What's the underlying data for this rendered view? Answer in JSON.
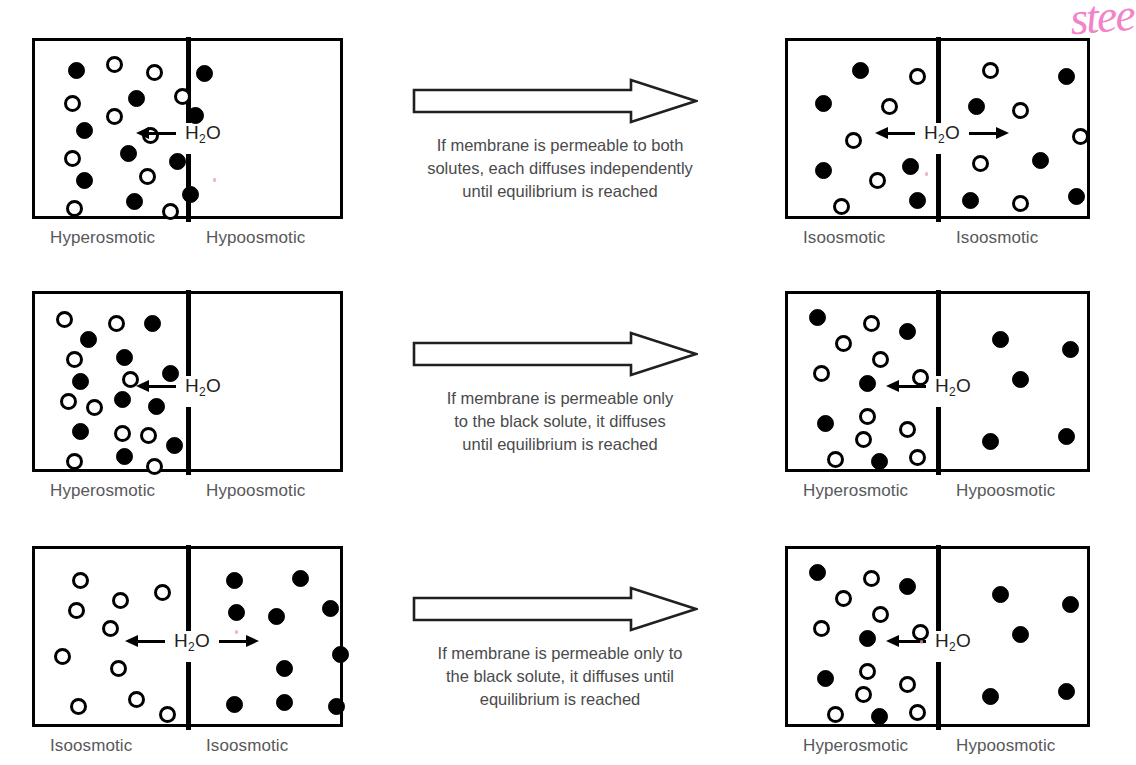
{
  "figure": {
    "handwriting_note": "stee",
    "h2o_label_main": "H",
    "h2o_label_sub": "2",
    "h2o_label_tail": "O"
  },
  "rows": [
    {
      "id": "row-permeable-both",
      "center": {
        "arrow_name": "process-arrow",
        "lines": [
          "If membrane is permeable to both",
          "solutes, each diffuses independently",
          "until equilibrium is reached"
        ]
      },
      "before": {
        "left_caption": "Hyperosmotic",
        "right_caption": "Hypoosmotic",
        "flow": "left",
        "left_particles": [
          {
            "t": "black",
            "x": 24,
            "y": 12
          },
          {
            "t": "white",
            "x": 62,
            "y": 6
          },
          {
            "t": "white",
            "x": 102,
            "y": 14
          },
          {
            "t": "black",
            "x": 152,
            "y": 15
          },
          {
            "t": "white",
            "x": 20,
            "y": 45
          },
          {
            "t": "black",
            "x": 84,
            "y": 40
          },
          {
            "t": "white",
            "x": 130,
            "y": 38
          },
          {
            "t": "white",
            "x": 62,
            "y": 58
          },
          {
            "t": "black",
            "x": 143,
            "y": 57
          },
          {
            "t": "black",
            "x": 32,
            "y": 72
          },
          {
            "t": "white",
            "x": 98,
            "y": 77
          },
          {
            "t": "black",
            "x": 76,
            "y": 95
          },
          {
            "t": "white",
            "x": 20,
            "y": 100
          },
          {
            "t": "black",
            "x": 125,
            "y": 103
          },
          {
            "t": "black",
            "x": 32,
            "y": 122
          },
          {
            "t": "white",
            "x": 95,
            "y": 118
          },
          {
            "t": "black",
            "x": 82,
            "y": 143
          },
          {
            "t": "black",
            "x": 138,
            "y": 136
          },
          {
            "t": "white",
            "x": 22,
            "y": 150
          },
          {
            "t": "white",
            "x": 118,
            "y": 153
          }
        ],
        "right_particles": []
      },
      "after": {
        "left_caption": "Isoosmotic",
        "right_caption": "Isoosmotic",
        "flow": "both",
        "left_particles": [
          {
            "t": "black",
            "x": 55,
            "y": 12
          },
          {
            "t": "white",
            "x": 112,
            "y": 18
          },
          {
            "t": "black",
            "x": 18,
            "y": 45
          },
          {
            "t": "white",
            "x": 84,
            "y": 48
          },
          {
            "t": "white",
            "x": 48,
            "y": 82
          },
          {
            "t": "black",
            "x": 18,
            "y": 112
          },
          {
            "t": "black",
            "x": 105,
            "y": 108
          },
          {
            "t": "white",
            "x": 72,
            "y": 122
          },
          {
            "t": "white",
            "x": 36,
            "y": 148
          },
          {
            "t": "black",
            "x": 112,
            "y": 142
          }
        ],
        "right_particles": [
          {
            "t": "white",
            "x": 32,
            "y": 12
          },
          {
            "t": "black",
            "x": 108,
            "y": 18
          },
          {
            "t": "black",
            "x": 18,
            "y": 48
          },
          {
            "t": "white",
            "x": 62,
            "y": 52
          },
          {
            "t": "white",
            "x": 122,
            "y": 78
          },
          {
            "t": "white",
            "x": 22,
            "y": 105
          },
          {
            "t": "black",
            "x": 82,
            "y": 102
          },
          {
            "t": "black",
            "x": 12,
            "y": 142
          },
          {
            "t": "white",
            "x": 62,
            "y": 145
          },
          {
            "t": "black",
            "x": 118,
            "y": 138
          }
        ]
      }
    },
    {
      "id": "row-permeable-black-only-1",
      "center": {
        "arrow_name": "process-arrow",
        "lines": [
          "If membrane is permeable only",
          "to the black solute, it diffuses",
          "until equilibrium is reached"
        ]
      },
      "before": {
        "left_caption": "Hyperosmotic",
        "right_caption": "Hypoosmotic",
        "flow": "left",
        "left_particles": [
          {
            "t": "white",
            "x": 12,
            "y": 8
          },
          {
            "t": "white",
            "x": 64,
            "y": 12
          },
          {
            "t": "black",
            "x": 100,
            "y": 12
          },
          {
            "t": "black",
            "x": 36,
            "y": 28
          },
          {
            "t": "white",
            "x": 22,
            "y": 48
          },
          {
            "t": "black",
            "x": 72,
            "y": 46
          },
          {
            "t": "black",
            "x": 118,
            "y": 62
          },
          {
            "t": "black",
            "x": 28,
            "y": 70
          },
          {
            "t": "white",
            "x": 78,
            "y": 68
          },
          {
            "t": "white",
            "x": 16,
            "y": 90
          },
          {
            "t": "black",
            "x": 70,
            "y": 88
          },
          {
            "t": "white",
            "x": 42,
            "y": 96
          },
          {
            "t": "black",
            "x": 104,
            "y": 95
          },
          {
            "t": "black",
            "x": 28,
            "y": 120
          },
          {
            "t": "white",
            "x": 70,
            "y": 122
          },
          {
            "t": "white",
            "x": 96,
            "y": 124
          },
          {
            "t": "black",
            "x": 122,
            "y": 134
          },
          {
            "t": "white",
            "x": 22,
            "y": 150
          },
          {
            "t": "black",
            "x": 72,
            "y": 145
          },
          {
            "t": "white",
            "x": 102,
            "y": 155
          }
        ],
        "right_particles": []
      },
      "after": {
        "left_caption": "Hyperosmotic",
        "right_caption": "Hypoosmotic",
        "flow": "left",
        "left_particles": [
          {
            "t": "black",
            "x": 12,
            "y": 6
          },
          {
            "t": "white",
            "x": 66,
            "y": 12
          },
          {
            "t": "black",
            "x": 102,
            "y": 20
          },
          {
            "t": "white",
            "x": 38,
            "y": 32
          },
          {
            "t": "white",
            "x": 75,
            "y": 48
          },
          {
            "t": "white",
            "x": 16,
            "y": 62
          },
          {
            "t": "white",
            "x": 115,
            "y": 66
          },
          {
            "t": "black",
            "x": 62,
            "y": 72
          },
          {
            "t": "white",
            "x": 62,
            "y": 105
          },
          {
            "t": "black",
            "x": 20,
            "y": 112
          },
          {
            "t": "white",
            "x": 102,
            "y": 118
          },
          {
            "t": "white",
            "x": 58,
            "y": 128
          },
          {
            "t": "white",
            "x": 30,
            "y": 148
          },
          {
            "t": "black",
            "x": 74,
            "y": 150
          },
          {
            "t": "white",
            "x": 112,
            "y": 146
          }
        ],
        "right_particles": [
          {
            "t": "black",
            "x": 42,
            "y": 28
          },
          {
            "t": "black",
            "x": 112,
            "y": 38
          },
          {
            "t": "black",
            "x": 62,
            "y": 68
          },
          {
            "t": "black",
            "x": 32,
            "y": 130
          },
          {
            "t": "black",
            "x": 108,
            "y": 125
          }
        ]
      }
    },
    {
      "id": "row-permeable-black-only-2",
      "center": {
        "arrow_name": "process-arrow",
        "lines": [
          "If membrane is permeable only to",
          "the black solute, it diffuses until",
          "equilibrium is reached"
        ]
      },
      "before": {
        "left_caption": "Isoosmotic",
        "right_caption": "Isoosmotic",
        "flow": "both",
        "left_particles": [
          {
            "t": "white",
            "x": 28,
            "y": 14
          },
          {
            "t": "white",
            "x": 110,
            "y": 26
          },
          {
            "t": "white",
            "x": 68,
            "y": 34
          },
          {
            "t": "white",
            "x": 24,
            "y": 44
          },
          {
            "t": "white",
            "x": 58,
            "y": 62
          },
          {
            "t": "white",
            "x": 10,
            "y": 90
          },
          {
            "t": "white",
            "x": 66,
            "y": 102
          },
          {
            "t": "white",
            "x": 84,
            "y": 133
          },
          {
            "t": "white",
            "x": 26,
            "y": 140
          },
          {
            "t": "white",
            "x": 115,
            "y": 148
          }
        ],
        "right_particles": [
          {
            "t": "black",
            "x": 26,
            "y": 14
          },
          {
            "t": "black",
            "x": 92,
            "y": 12
          },
          {
            "t": "black",
            "x": 28,
            "y": 46
          },
          {
            "t": "black",
            "x": 68,
            "y": 50
          },
          {
            "t": "black",
            "x": 122,
            "y": 42
          },
          {
            "t": "black",
            "x": 132,
            "y": 88
          },
          {
            "t": "black",
            "x": 76,
            "y": 102
          },
          {
            "t": "black",
            "x": 26,
            "y": 138
          },
          {
            "t": "black",
            "x": 76,
            "y": 136
          },
          {
            "t": "black",
            "x": 128,
            "y": 140
          }
        ]
      },
      "after": {
        "left_caption": "Hyperosmotic",
        "right_caption": "Hypoosmotic",
        "flow": "left",
        "left_particles": [
          {
            "t": "black",
            "x": 12,
            "y": 6
          },
          {
            "t": "white",
            "x": 66,
            "y": 12
          },
          {
            "t": "black",
            "x": 102,
            "y": 20
          },
          {
            "t": "white",
            "x": 38,
            "y": 32
          },
          {
            "t": "white",
            "x": 75,
            "y": 48
          },
          {
            "t": "white",
            "x": 16,
            "y": 62
          },
          {
            "t": "white",
            "x": 115,
            "y": 66
          },
          {
            "t": "black",
            "x": 62,
            "y": 72
          },
          {
            "t": "white",
            "x": 62,
            "y": 105
          },
          {
            "t": "black",
            "x": 20,
            "y": 112
          },
          {
            "t": "white",
            "x": 102,
            "y": 118
          },
          {
            "t": "white",
            "x": 58,
            "y": 128
          },
          {
            "t": "white",
            "x": 30,
            "y": 148
          },
          {
            "t": "black",
            "x": 74,
            "y": 150
          },
          {
            "t": "white",
            "x": 112,
            "y": 146
          }
        ],
        "right_particles": [
          {
            "t": "black",
            "x": 42,
            "y": 28
          },
          {
            "t": "black",
            "x": 112,
            "y": 38
          },
          {
            "t": "black",
            "x": 62,
            "y": 68
          },
          {
            "t": "black",
            "x": 32,
            "y": 130
          },
          {
            "t": "black",
            "x": 108,
            "y": 125
          }
        ]
      }
    }
  ]
}
